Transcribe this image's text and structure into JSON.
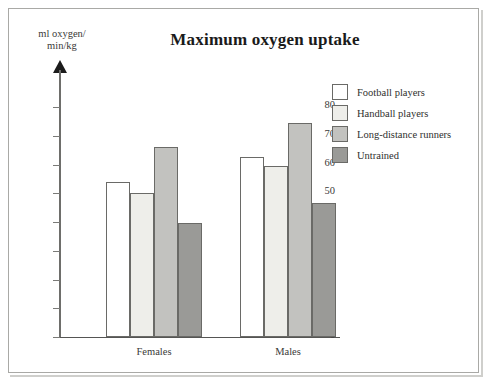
{
  "chart_data": {
    "type": "bar",
    "title": "Maximum oxygen uptake",
    "ylabel_line1": "ml oxygen/",
    "ylabel_line2": "min/kg",
    "xlabel": "",
    "categories": [
      "Females",
      "Males"
    ],
    "series": [
      {
        "name": "Football players",
        "values": [
          54,
          62.5
        ],
        "color": "#ffffff"
      },
      {
        "name": "Handball players",
        "values": [
          50,
          59.5
        ],
        "color": "#eeeeea"
      },
      {
        "name": "Long-distance runners",
        "values": [
          66,
          74.5
        ],
        "color": "#c2c2bf"
      },
      {
        "name": "Untrained",
        "values": [
          39.5,
          46.5
        ],
        "color": "#9a9a97"
      }
    ],
    "yticks": [
      0,
      10,
      20,
      30,
      40,
      50,
      60,
      70,
      80
    ],
    "ytick_labels": [
      "0",
      "10",
      "20",
      "30",
      "40",
      "50",
      "60",
      "70",
      "80"
    ],
    "ylim": [
      0,
      80
    ],
    "grid": false,
    "legend_position": "top-right",
    "axis_arrow": true
  },
  "legend": {
    "items": [
      {
        "label": "Football players"
      },
      {
        "label": "Handball players"
      },
      {
        "label": "Long-distance runners"
      },
      {
        "label": "Untrained"
      }
    ]
  },
  "colors": {
    "football": "#ffffff",
    "handball": "#eeeeea",
    "runners": "#c2c2bf",
    "untrained": "#9a9a97",
    "outline": "#6a6a67",
    "axis": "#6e6e6b",
    "frame": "#a9a9a6",
    "text": "#2f2f2d",
    "background": "#ffffff"
  }
}
